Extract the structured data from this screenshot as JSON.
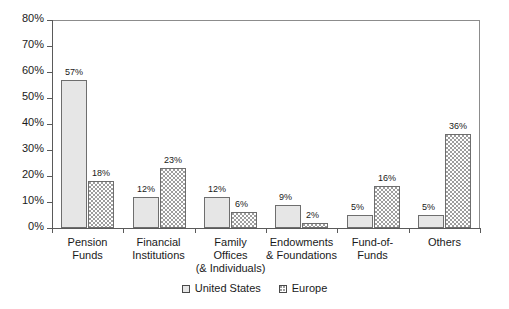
{
  "chart_data": {
    "type": "bar",
    "title": "",
    "subtitle": "",
    "xlabel": "",
    "ylabel": "",
    "ylim": [
      0,
      80
    ],
    "y_tick_labels": [
      "0%",
      "10%",
      "20%",
      "30%",
      "40%",
      "50%",
      "60%",
      "70%",
      "80%"
    ],
    "y_ticks": [
      0,
      10,
      20,
      30,
      40,
      50,
      60,
      70,
      80
    ],
    "grid": false,
    "legend_position": "bottom",
    "value_suffix": "%",
    "categories": [
      "Pension Funds",
      "Financial Institutions",
      "Family Offices (& Individuals)",
      "Endowments & Foundations",
      "Fund-of-Funds",
      "Others"
    ],
    "category_label_lines": [
      [
        "Pension",
        "Funds"
      ],
      [
        "Financial",
        "Institutions"
      ],
      [
        "Family",
        "Offices",
        "(& Individuals)"
      ],
      [
        "Endowments",
        "& Foundations"
      ],
      [
        "Fund-of-",
        "Funds"
      ],
      [
        "Others"
      ]
    ],
    "series": [
      {
        "name": "United States",
        "values": [
          57,
          12,
          12,
          9,
          5,
          5
        ],
        "labels": [
          "57%",
          "12%",
          "12%",
          "9%",
          "5%",
          "5%"
        ],
        "fill": "solid-light-gray",
        "color": "#e6e6e6"
      },
      {
        "name": "Europe",
        "values": [
          18,
          23,
          6,
          2,
          16,
          36
        ],
        "labels": [
          "18%",
          "23%",
          "6%",
          "2%",
          "16%",
          "36%"
        ],
        "fill": "dotted-white",
        "color": "#ffffff"
      }
    ]
  },
  "legend": {
    "items": [
      {
        "label": "United States",
        "swatch": "legend-swatch-united-states"
      },
      {
        "label": "Europe",
        "swatch": "legend-swatch-europe"
      }
    ]
  },
  "colors": {
    "axis": "#5a5a5a",
    "frame": "#8c8c8c",
    "bar_border": "#6e6e6e",
    "us_fill": "#e6e6e6",
    "eu_fill": "#ffffff",
    "text": "#1a1a1a",
    "background": "#ffffff"
  }
}
